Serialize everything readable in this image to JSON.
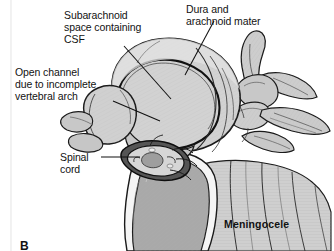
{
  "figure": {
    "panel_letter": "B",
    "condition_title": "Meningocele",
    "background_color": "#ffffff",
    "ink_color": "#121212",
    "tissue_fill": "#d4d4d4",
    "bone_fill": "#c9c9c9",
    "cancellous_fill": "#a8a8a8",
    "cortical_rim": "#f4f4f4"
  },
  "annotations": [
    {
      "id": "subarachnoid",
      "name": "subarachnoid-space-label",
      "lines": [
        "Subarachnoid",
        "space containing",
        "CSF"
      ],
      "text": "Subarachnoid\nspace containing\nCSF"
    },
    {
      "id": "dura",
      "name": "dura-arachnoid-label",
      "lines": [
        "Dura and",
        "arachnoid mater"
      ],
      "text": "Dura and\narachnoid mater"
    },
    {
      "id": "open-channel",
      "name": "open-channel-label",
      "lines": [
        "Open channel",
        "due to incomplete",
        "vertebral arch"
      ],
      "text": "Open channel\ndue to incomplete\nvertebral arch"
    },
    {
      "id": "spinal-cord",
      "name": "spinal-cord-label",
      "lines": [
        "Spinal",
        "cord"
      ],
      "text": "Spinal\ncord"
    }
  ],
  "caption": {
    "diagnosis": "Meningocele",
    "panel": "B"
  }
}
